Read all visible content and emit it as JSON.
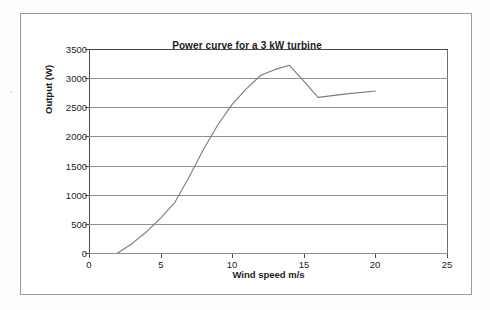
{
  "document": {
    "background_color": "#ffffff",
    "frame_color": "#9a9a9a",
    "margin_artifact": "´"
  },
  "chart_data": {
    "type": "line",
    "title": "Power curve for a 3 kW turbine",
    "xlabel": "Wind speed m/s",
    "ylabel": "Output (W)",
    "xlim": [
      0,
      25
    ],
    "ylim": [
      0,
      3500
    ],
    "xticks": [
      0,
      5,
      10,
      15,
      20,
      25
    ],
    "xtick_labels": [
      "0",
      "5",
      "10",
      "15",
      "20",
      "25"
    ],
    "yticks": [
      0,
      500,
      1000,
      1500,
      2000,
      2500,
      3000,
      3500
    ],
    "ytick_labels": [
      "0",
      "500",
      "1000",
      "1500",
      "2000",
      "2500",
      "3000",
      "3500"
    ],
    "grid": "horizontal",
    "legend": "none",
    "line_color": "#7b7b7b",
    "series": [
      {
        "name": "Output (W)",
        "x": [
          2,
          3,
          4,
          5,
          6,
          7,
          8,
          9,
          10,
          11,
          12,
          13,
          14,
          15,
          16,
          18,
          20
        ],
        "y": [
          0,
          160,
          360,
          600,
          870,
          1310,
          1780,
          2200,
          2550,
          2820,
          3050,
          3150,
          3220,
          2950,
          2670,
          2730,
          2780
        ]
      }
    ]
  }
}
